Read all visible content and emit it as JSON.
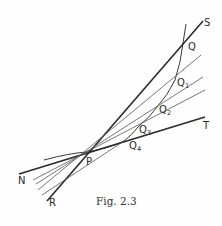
{
  "figure": {
    "caption": "Fig. 2.3",
    "points": {
      "P": "P",
      "Q": "Q",
      "Q1": {
        "base": "Q",
        "sub": "1"
      },
      "Q2": {
        "base": "Q",
        "sub": "2"
      },
      "Q3": {
        "base": "Q",
        "sub": "3"
      },
      "Q4": {
        "base": "Q",
        "sub": "4"
      }
    },
    "line_labels": {
      "S": "S",
      "T": "T",
      "N": "N",
      "R": "R"
    }
  },
  "colors": {
    "ink": "#2a2a2a",
    "thin_ink": "#555555",
    "background": "#fefefe"
  }
}
